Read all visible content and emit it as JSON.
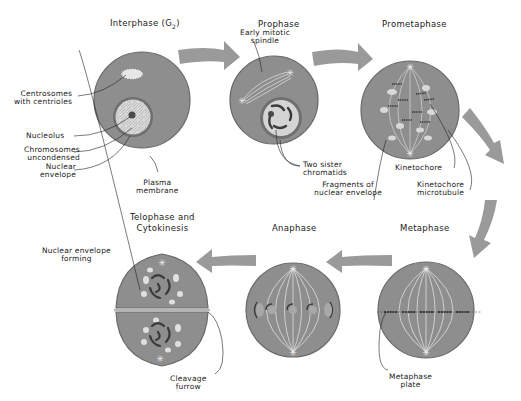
{
  "figure": {
    "type": "mitosis-stages-diagram",
    "colors": {
      "cytoplasm": "#8e8e8e",
      "cell_outline": "#6a6a6a",
      "nucleus": "#d4d4d4",
      "light": "#e4e4e4",
      "chromosome": "#3a3a3a",
      "arrow": "#9a9a9a",
      "leader_line": "#222222"
    }
  },
  "stages": [
    {
      "title": "Interphase (G",
      "title_sub": "2",
      "title_end": ")",
      "labels": [
        {
          "text_1": "Centrosomes",
          "text_2": "with centrioles"
        },
        {
          "text_1": "Nucleolus"
        },
        {
          "text_1": "Chromosomes",
          "text_2": "uncondensed"
        },
        {
          "text_1": "Nuclear",
          "text_2": "envelope"
        },
        {
          "text_1": "Plasma",
          "text_2": "membrane"
        }
      ]
    },
    {
      "title": "Prophase",
      "labels": [
        {
          "text_1": "Early mitotic",
          "text_2": "spindle"
        },
        {
          "text_1": "Two sister",
          "text_2": "chromatids"
        }
      ]
    },
    {
      "title": "Prometaphase",
      "labels": [
        {
          "text_1": "Fragments of",
          "text_2": "nuclear envelope"
        },
        {
          "text_1": "Kinetochore"
        },
        {
          "text_1": "Kinetochore",
          "text_2": "microtubule"
        }
      ]
    },
    {
      "title": "Metaphase",
      "labels": [
        {
          "text_1": "Metaphase",
          "text_2": "plate"
        }
      ]
    },
    {
      "title": "Anaphase",
      "labels": []
    },
    {
      "title_1": "Telophase and",
      "title_2": "Cytokinesis",
      "labels": [
        {
          "text_1": "Nuclear envelope",
          "text_2": "forming"
        },
        {
          "text_1": "Cleavage",
          "text_2": "furrow"
        }
      ]
    }
  ]
}
